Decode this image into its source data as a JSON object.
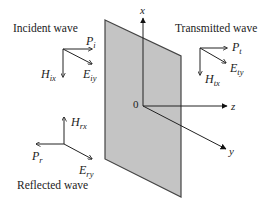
{
  "diagram": {
    "plate": {
      "fill": "#c4c4c4",
      "stroke": "#444444"
    },
    "axes": {
      "origin_label": "0",
      "x_label": "x",
      "z_label": "z",
      "y_label": "y"
    },
    "incident": {
      "title": "Incident wave",
      "power": {
        "symbol": "P",
        "sub": "i"
      },
      "e_field": {
        "symbol": "E",
        "sub": "iy"
      },
      "h_field": {
        "symbol": "H",
        "sub": "ix"
      }
    },
    "transmitted": {
      "title": "Transmitted wave",
      "power": {
        "symbol": "P",
        "sub": "t"
      },
      "e_field": {
        "symbol": "E",
        "sub": "ty"
      },
      "h_field": {
        "symbol": "H",
        "sub": "tx"
      }
    },
    "reflected": {
      "title": "Reflected wave",
      "power": {
        "symbol": "P",
        "sub": "r"
      },
      "e_field": {
        "symbol": "E",
        "sub": "ry"
      },
      "h_field": {
        "symbol": "H",
        "sub": "rx"
      }
    }
  }
}
